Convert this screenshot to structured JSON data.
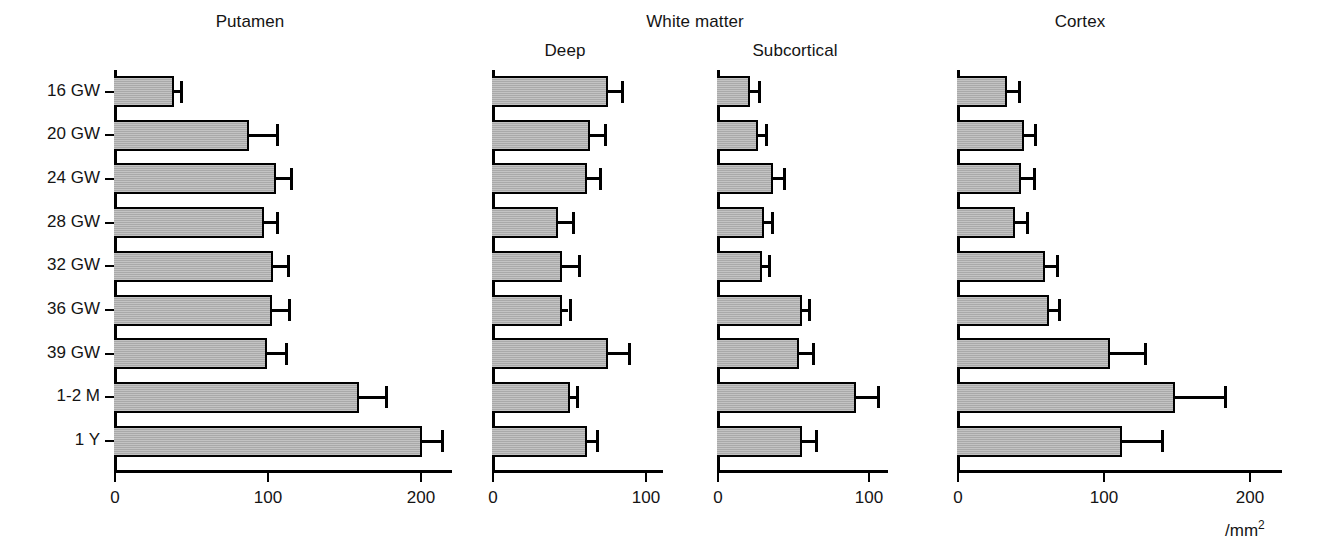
{
  "figure": {
    "group_titles": [
      {
        "label": "Putamen"
      },
      {
        "label": "White matter"
      },
      {
        "label": "Cortex"
      }
    ],
    "sub_titles": [
      {
        "label": "Deep"
      },
      {
        "label": "Subcortical"
      }
    ],
    "unit_label": "/mm2",
    "unit_base": "/mm",
    "unit_exp": "2"
  },
  "chart_data": {
    "type": "bar",
    "orientation": "horizontal",
    "title": "",
    "xlabel": "/mm2",
    "ylabel": "",
    "grid": false,
    "legend": null,
    "categories": [
      "16 GW",
      "20 GW",
      "24 GW",
      "28 GW",
      "32 GW",
      "36 GW",
      "39 GW",
      "1-2 M",
      "1 Y"
    ],
    "panels": [
      {
        "name": "Putamen",
        "group": "Putamen",
        "xlim": [
          0,
          222
        ],
        "xticks": [
          0,
          100,
          200
        ],
        "xticklabels": [
          "0",
          "100",
          "200"
        ],
        "values": [
          39,
          88,
          106,
          98,
          104,
          103,
          100,
          160,
          201
        ],
        "errors": [
          4,
          18,
          9,
          8,
          9,
          11,
          12,
          17,
          13
        ]
      },
      {
        "name": "White matter Deep",
        "group": "White matter",
        "sub": "Deep",
        "xlim": [
          0,
          112
        ],
        "xticks": [
          0,
          100
        ],
        "xticklabels": [
          "0",
          "100"
        ],
        "values": [
          76,
          64,
          62,
          43,
          46,
          46,
          76,
          51,
          62
        ],
        "errors": [
          8,
          9,
          8,
          9,
          10,
          4,
          13,
          4,
          6
        ]
      },
      {
        "name": "White matter Subcortical",
        "group": "White matter",
        "sub": "Subcortical",
        "xlim": [
          0,
          112
        ],
        "xticks": [
          0,
          100
        ],
        "xticklabels": [
          "0",
          "100"
        ],
        "values": [
          22,
          27,
          37,
          31,
          30,
          56,
          54,
          92,
          56
        ],
        "errors": [
          5,
          5,
          7,
          5,
          4,
          4,
          9,
          14,
          9
        ]
      },
      {
        "name": "Cortex",
        "group": "Cortex",
        "xlim": [
          0,
          222
        ],
        "xticks": [
          0,
          100,
          200
        ],
        "xticklabels": [
          "0",
          "100",
          "200"
        ],
        "values": [
          34,
          46,
          44,
          40,
          60,
          63,
          105,
          149,
          113
        ],
        "errors": [
          8,
          7,
          8,
          7,
          8,
          6,
          23,
          34,
          27
        ]
      }
    ]
  },
  "style": {
    "bar_fill": "#a9a9a9",
    "bar_stroke": "#000000",
    "axis_color": "#000000",
    "text_color": "#141414"
  }
}
